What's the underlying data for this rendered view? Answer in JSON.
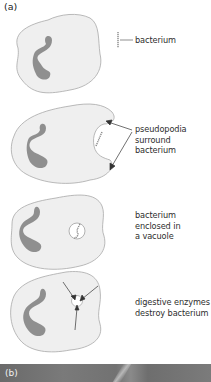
{
  "figure": {
    "panel_a_label": "(a)",
    "panel_b_label": "(b)",
    "colors": {
      "cytoplasm": "#efefef",
      "outline": "#a8a8a8",
      "nucleus": "#8f8f8f",
      "photo": "#747474",
      "arrow": "#333333"
    },
    "stages": [
      {
        "id": 1,
        "caption_lines": [
          "bacterium"
        ],
        "annotation": "label line pointing to bacterium"
      },
      {
        "id": 2,
        "caption_lines": [
          "pseudopodia",
          "surround",
          "bacterium"
        ],
        "annotation": "two arrows pointing to pseudopodia"
      },
      {
        "id": 3,
        "caption_lines": [
          "bacterium",
          "enclosed in",
          "a vacuole"
        ],
        "annotation": "vacuole containing bacterium"
      },
      {
        "id": 4,
        "caption_lines": [
          "digestive enzymes",
          "destroy bacterium"
        ],
        "annotation": "three arrows pointing into vacuole"
      }
    ]
  }
}
